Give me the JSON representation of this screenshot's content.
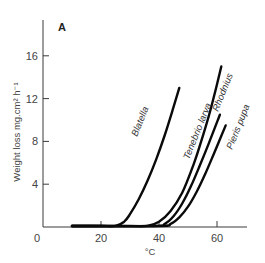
{
  "chart_data": {
    "type": "line",
    "title": "",
    "panel_label": "A",
    "xlabel": "°C",
    "ylabel": "Weight loss mg.cm² h⁻¹",
    "xlim": [
      0,
      70
    ],
    "ylim": [
      0,
      18
    ],
    "x_ticks": [
      0,
      20,
      40,
      60
    ],
    "x_tick_labels": [
      "0",
      "20",
      "40",
      "60"
    ],
    "y_ticks": [
      4,
      8,
      12,
      16
    ],
    "y_tick_labels": [
      "4",
      "8",
      "12",
      "16"
    ],
    "grid": false,
    "legend": "inline curve labels",
    "series": [
      {
        "name": "Blatella",
        "x": [
          10,
          20,
          25,
          28,
          30,
          33,
          36,
          39,
          42,
          45,
          47
        ],
        "values": [
          0,
          0,
          0.1,
          0.5,
          1.2,
          2.6,
          4.3,
          6.3,
          8.6,
          11.2,
          13.0
        ]
      },
      {
        "name": "Tenebrio larva",
        "x": [
          10,
          30,
          36,
          40,
          44,
          48,
          52,
          55,
          58,
          61.5
        ],
        "values": [
          0,
          0,
          0.1,
          0.5,
          1.5,
          3.2,
          5.9,
          8.4,
          11.2,
          15.0
        ]
      },
      {
        "name": "Rhodnius",
        "x": [
          10,
          38,
          42,
          45,
          48,
          51,
          54,
          57,
          61
        ],
        "values": [
          0,
          0,
          0.3,
          1.0,
          2.2,
          3.8,
          5.7,
          7.7,
          10.5
        ]
      },
      {
        "name": "Pieris pupa",
        "x": [
          10,
          40,
          44,
          47,
          50,
          53,
          56,
          59,
          63
        ],
        "values": [
          0,
          0,
          0.3,
          0.9,
          1.9,
          3.3,
          5.0,
          6.9,
          9.5
        ]
      }
    ]
  }
}
